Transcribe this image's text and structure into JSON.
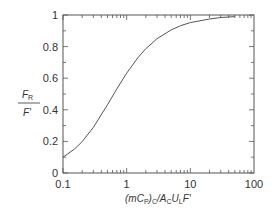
{
  "chart_data": {
    "type": "line",
    "title": "",
    "xlabel": "(mC_P)_C/A_C U_L F'",
    "xlabel_parts": {
      "open": "(",
      "m": "mC",
      "p_sub": "P",
      "close": ")",
      "c_sub": "C",
      "slash": "/A",
      "ac_sub": "C",
      "u": "U",
      "l_sub": "L",
      "f": "F'"
    },
    "ylabel": "F_R / F'",
    "ylabel_parts": {
      "num": "F",
      "num_sub": "R",
      "den": "F'"
    },
    "xscale": "log",
    "xlim": [
      0.1,
      100
    ],
    "ylim": [
      0,
      1
    ],
    "x_ticks": [
      "0.1",
      "1",
      "10",
      "100"
    ],
    "y_ticks": [
      "0",
      "0.2",
      "0.4",
      "0.6",
      "0.8",
      "1"
    ],
    "grid": false,
    "legend": null,
    "series": [
      {
        "name": "F_R/F'",
        "x": [
          0.1,
          0.15,
          0.2,
          0.3,
          0.5,
          0.7,
          1,
          1.5,
          2,
          3,
          5,
          7,
          10,
          20,
          30,
          50
        ],
        "values": [
          0.1,
          0.15,
          0.199,
          0.289,
          0.432,
          0.532,
          0.632,
          0.73,
          0.787,
          0.85,
          0.906,
          0.932,
          0.952,
          0.975,
          0.984,
          0.99
        ]
      }
    ]
  }
}
